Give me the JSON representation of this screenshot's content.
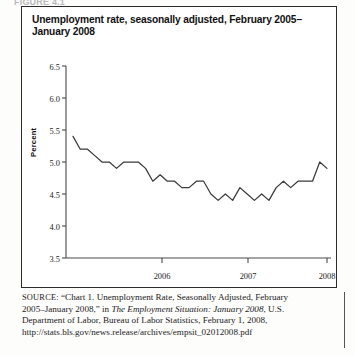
{
  "clipped_header": "FIGURE 4.1",
  "figure": {
    "title": "Unemployment rate, seasonally adjusted, February 2005–January 2008"
  },
  "source": {
    "label": "SOURCE:",
    "line1": "“Chart 1. Unemployment Rate, Seasonally Adjusted, February",
    "line2_pre": "2005–January 2008,” in ",
    "line2_italic": "The Employment Situation: January 2008",
    "line2_post": ", U.S.",
    "line3": "Department of Labor, Bureau of Labor Statistics, February 1, 2008,",
    "line4": "http://stats.bls.gov/news.release/archives/empsit_02012008.pdf"
  },
  "chart_data": {
    "type": "line",
    "title": "Unemployment rate, seasonally adjusted, February 2005–January 2008",
    "xlabel": "",
    "ylabel": "Percent",
    "ylim": [
      3.5,
      6.5
    ],
    "ytick_labels": [
      "6.5",
      "6.0",
      "5.5",
      "5.0",
      "4.5",
      "4.0",
      "3.5"
    ],
    "ytick_values": [
      6.5,
      6.0,
      5.5,
      5.0,
      4.5,
      4.0,
      3.5
    ],
    "xtick_labels": [
      "2006",
      "2007",
      "2008"
    ],
    "xtick_values": [
      "2006-01",
      "2007-01",
      "2008-01"
    ],
    "grid": false,
    "legend": false,
    "line_color": "#3a3a3a",
    "x": [
      "2005-02",
      "2005-03",
      "2005-04",
      "2005-05",
      "2005-06",
      "2005-07",
      "2005-08",
      "2005-09",
      "2005-10",
      "2005-11",
      "2005-12",
      "2006-01",
      "2006-02",
      "2006-03",
      "2006-04",
      "2006-05",
      "2006-06",
      "2006-07",
      "2006-08",
      "2006-09",
      "2006-10",
      "2006-11",
      "2006-12",
      "2007-01",
      "2007-02",
      "2007-03",
      "2007-04",
      "2007-05",
      "2007-06",
      "2007-07",
      "2007-08",
      "2007-09",
      "2007-10",
      "2007-11",
      "2007-12",
      "2008-01"
    ],
    "values": [
      5.4,
      5.2,
      5.2,
      5.1,
      5.0,
      5.0,
      4.9,
      5.0,
      5.0,
      5.0,
      4.9,
      4.7,
      4.8,
      4.7,
      4.7,
      4.6,
      4.6,
      4.7,
      4.7,
      4.5,
      4.4,
      4.5,
      4.4,
      4.6,
      4.5,
      4.4,
      4.5,
      4.4,
      4.6,
      4.7,
      4.6,
      4.7,
      4.7,
      4.7,
      5.0,
      4.9
    ],
    "series_name": "Unemployment rate"
  }
}
